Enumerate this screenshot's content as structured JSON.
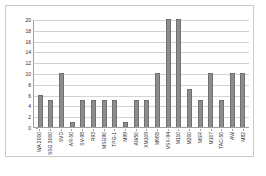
{
  "chart_data": {
    "type": "bar",
    "title": "",
    "subtitle": "",
    "xlabel": "",
    "ylabel": "",
    "ylim": [
      0,
      20
    ],
    "ytick_step": 2,
    "yticks": [
      20,
      18,
      16,
      14,
      12,
      10,
      8,
      6,
      4,
      2,
      0
    ],
    "grid": true,
    "grid_axis": "y",
    "legend": false,
    "legend_position": "none",
    "categories": [
      "WA 2000",
      "SSG 3000",
      "SVD",
      "AR-50",
      "SV-98",
      "R93",
      "MSG90",
      "TPG-1",
      "M99",
      "AW50",
      "XM109",
      "M98B",
      "VSK-94",
      "M110",
      "M200",
      "MSR",
      "M107",
      "TAC-50",
      "AW",
      "M82"
    ],
    "values": [
      6,
      5,
      10,
      1,
      5,
      5,
      5,
      5,
      1,
      5,
      5,
      10,
      20,
      20,
      7,
      5,
      10,
      5,
      10,
      10
    ],
    "bar_color": "#8d8d8d",
    "bar_edge_color": "#6f6f6f",
    "grid_color": "#d2d2d2",
    "axis_color": "#a0a0a0",
    "frame_color": "#c9c9c9",
    "background": "#ffffff"
  },
  "caption": {
    "text": ""
  }
}
